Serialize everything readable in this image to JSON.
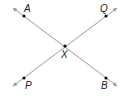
{
  "diagram": {
    "colors": {
      "line": "#9a9a9a",
      "point": "#111111",
      "label": "#222222"
    },
    "lines": [
      {
        "name": "line-AB",
        "from": [
          13,
          8
        ],
        "to": [
          117,
          86
        ]
      },
      {
        "name": "line-PQ",
        "from": [
          13,
          86
        ],
        "to": [
          117,
          8
        ]
      }
    ],
    "points": [
      {
        "id": "A",
        "label": "A",
        "x": 24,
        "y": 16,
        "lx": 24,
        "ly": 12
      },
      {
        "id": "Q",
        "label": "Q",
        "x": 106,
        "y": 16,
        "lx": 100,
        "ly": 12
      },
      {
        "id": "X",
        "label": "X",
        "x": 65,
        "y": 46,
        "lx": 61,
        "ly": 58
      },
      {
        "id": "P",
        "label": "P",
        "x": 24,
        "y": 78,
        "lx": 25,
        "ly": 89
      },
      {
        "id": "B",
        "label": "B",
        "x": 106,
        "y": 78,
        "lx": 101,
        "ly": 89
      }
    ]
  }
}
